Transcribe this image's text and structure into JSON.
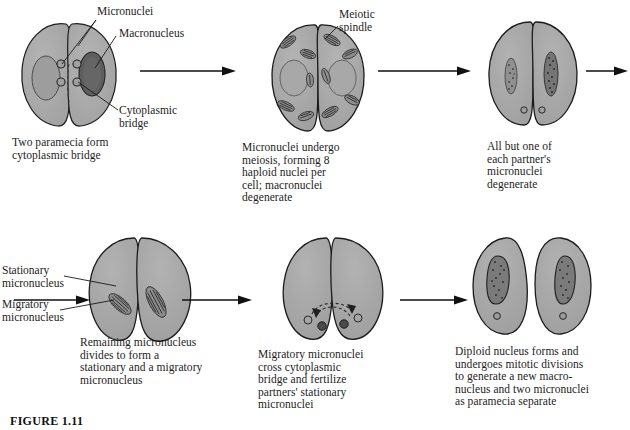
{
  "figure": {
    "number": "FIGURE 1.11"
  },
  "colors": {
    "cell_fill": "#a9a9a9",
    "cell_stroke": "#1c1c1c",
    "macronucleus_fill": "#8f8f8f",
    "micronucleus_fill": "#9a9a9a",
    "arrow": "#111111",
    "leader_line": "#1a1a1a",
    "text": "#1d1d1d",
    "background": "#ffffff"
  },
  "steps": [
    {
      "id": "step-1",
      "caption": "Two paramecia form\ncytoplasmic bridge",
      "labels": [
        {
          "id": "micronuclei",
          "text": "Micronuclei"
        },
        {
          "id": "macronucleus",
          "text": "Macronucleus"
        },
        {
          "id": "cytoplasmic-bridge",
          "text": "Cytoplasmic\nbridge"
        }
      ]
    },
    {
      "id": "step-2",
      "caption": "Micronuclei undergo\nmeiosis, forming 8\nhaploid nuclei per\ncell; macronuclei\ndegenerate",
      "labels": [
        {
          "id": "meiotic-spindle",
          "text": "Meiotic\nspindle"
        }
      ]
    },
    {
      "id": "step-3",
      "caption": "All but one of\neach partner's\nmicronuclei\ndegenerate",
      "labels": []
    },
    {
      "id": "step-4",
      "caption": "Remaining micronucleus\ndivides to form a\nstationary and a migratory\nmicronucleus",
      "labels": [
        {
          "id": "stationary-micronucleus",
          "text": "Stationary\nmicronucleus"
        },
        {
          "id": "migratory-micronucleus",
          "text": "Migratory\nmicronucleus"
        }
      ]
    },
    {
      "id": "step-5",
      "caption": "Migratory micronuclei\ncross cytoplasmic\nbridge and fertilize\npartners' stationary\nmicronuclei",
      "labels": []
    },
    {
      "id": "step-6",
      "caption": "Diploid nucleus forms and\nundergoes mitotic divisions\nto generate a new macro-\nnucleus and two micronuclei\nas paramecia separate",
      "labels": []
    }
  ],
  "arrows": [
    {
      "id": "arrow-1-2",
      "direction": "right"
    },
    {
      "id": "arrow-2-3",
      "direction": "right"
    },
    {
      "id": "arrow-3-wrap",
      "direction": "right"
    },
    {
      "id": "arrow-wrap-4",
      "direction": "right"
    },
    {
      "id": "arrow-4-5",
      "direction": "right"
    },
    {
      "id": "arrow-5-6",
      "direction": "right"
    }
  ]
}
